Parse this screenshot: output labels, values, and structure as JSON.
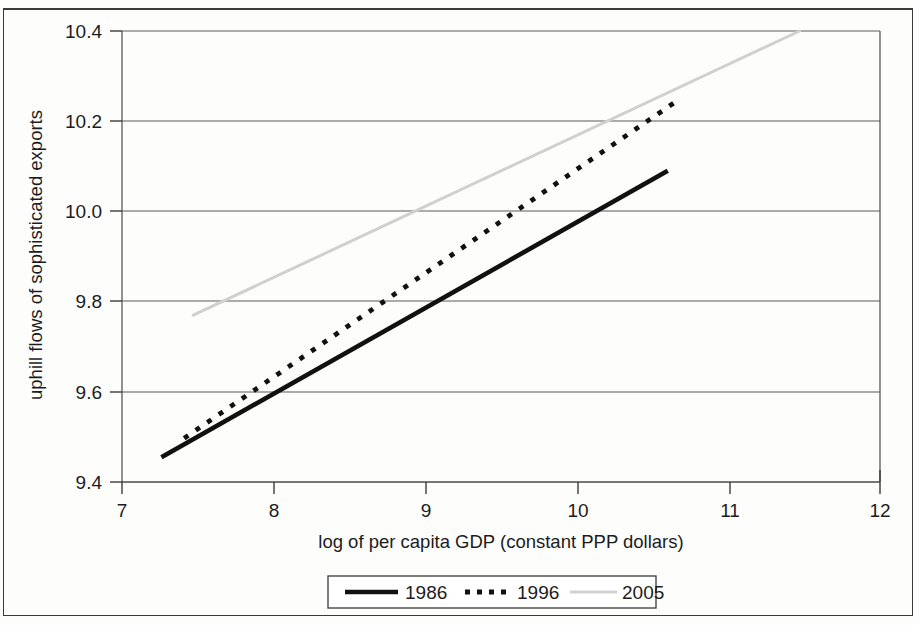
{
  "chart_data": {
    "type": "line",
    "title": "",
    "xlabel": "log of per capita GDP (constant PPP dollars)",
    "ylabel": "uphill flows of sophisticated exports",
    "xlim": [
      7,
      12
    ],
    "ylim": [
      9.4,
      10.4
    ],
    "xticks": [
      "7",
      "8",
      "9",
      "10",
      "11",
      "12"
    ],
    "yticks": [
      "9.4",
      "9.6",
      "9.8",
      "10.0",
      "10.2",
      "10.4"
    ],
    "grid": "horizontal",
    "legend_position": "bottom-outside",
    "series": [
      {
        "name": "1986",
        "style": "solid",
        "color": "#111111",
        "x": [
          7.26,
          10.6
        ],
        "y": [
          9.455,
          10.09
        ]
      },
      {
        "name": "1996",
        "style": "dotted",
        "color": "#111111",
        "x": [
          7.41,
          10.66
        ],
        "y": [
          9.497,
          10.245
        ]
      },
      {
        "name": "2005",
        "style": "solid-light",
        "color": "#d0d0d0",
        "x": [
          7.47,
          11.47
        ],
        "y": [
          9.77,
          10.4
        ]
      }
    ]
  },
  "axes": {
    "x_title": "log of per capita GDP (constant PPP dollars)",
    "y_title": "uphill flows of sophisticated exports",
    "x_tick_labels": [
      "7",
      "8",
      "9",
      "10",
      "11",
      "12"
    ],
    "y_tick_labels": [
      "9.4",
      "9.6",
      "9.8",
      "10.0",
      "10.2",
      "10.4"
    ]
  },
  "legend": {
    "items": [
      {
        "label": "1986",
        "marker": "solid-line"
      },
      {
        "label": "1996",
        "marker": "dotted-line"
      },
      {
        "label": "2005",
        "marker": "light-gray-line"
      }
    ]
  }
}
